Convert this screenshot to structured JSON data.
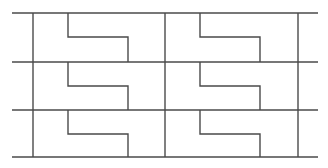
{
  "figure": {
    "width": 328,
    "height": 168,
    "background_color": "#ffffff",
    "line_color": "#4a4a4a",
    "line_width": 1.4
  },
  "geometry": {
    "frame": {
      "left": 33,
      "right": 298,
      "top": 13,
      "bottom": 157,
      "horizontal_overhang_left": 12,
      "horizontal_overhang_right": 318
    },
    "horizontal_lines_y": [
      13,
      62,
      110,
      157
    ],
    "vertical_lines_x": [
      33,
      165,
      298
    ],
    "columns": [
      {
        "name": "left-column",
        "x_start": 33,
        "x_end": 165
      },
      {
        "name": "right-column",
        "x_start": 165,
        "x_end": 298
      }
    ],
    "rows": [
      {
        "name": "top-row",
        "y_top": 13,
        "y_bottom": 62,
        "y_step": 37
      },
      {
        "name": "middle-row",
        "y_top": 62,
        "y_bottom": 110,
        "y_step": 86
      },
      {
        "name": "bottom-row",
        "y_top": 110,
        "y_bottom": 157,
        "y_step": 134
      }
    ],
    "tile_offsets": {
      "left_vertical_offset": 35,
      "right_vertical_offset": 95
    }
  },
  "tiles": [
    {
      "name": "tile-top-left",
      "row": "top-row",
      "column": "left-column",
      "left_vertical_x": 68,
      "right_vertical_x": 128,
      "y_top": 13,
      "y_step": 37,
      "y_bottom": 62
    },
    {
      "name": "tile-top-right",
      "row": "top-row",
      "column": "right-column",
      "left_vertical_x": 200,
      "right_vertical_x": 260,
      "y_top": 13,
      "y_step": 37,
      "y_bottom": 62
    },
    {
      "name": "tile-middle-left",
      "row": "middle-row",
      "column": "left-column",
      "left_vertical_x": 68,
      "right_vertical_x": 128,
      "y_top": 62,
      "y_step": 86,
      "y_bottom": 110
    },
    {
      "name": "tile-middle-right",
      "row": "middle-row",
      "column": "right-column",
      "left_vertical_x": 200,
      "right_vertical_x": 260,
      "y_top": 62,
      "y_step": 86,
      "y_bottom": 110
    },
    {
      "name": "tile-bottom-left",
      "row": "bottom-row",
      "column": "left-column",
      "left_vertical_x": 68,
      "right_vertical_x": 128,
      "y_top": 110,
      "y_step": 134,
      "y_bottom": 157
    },
    {
      "name": "tile-bottom-right",
      "row": "bottom-row",
      "column": "right-column",
      "left_vertical_x": 200,
      "right_vertical_x": 260,
      "y_top": 110,
      "y_step": 134,
      "y_bottom": 157
    }
  ]
}
